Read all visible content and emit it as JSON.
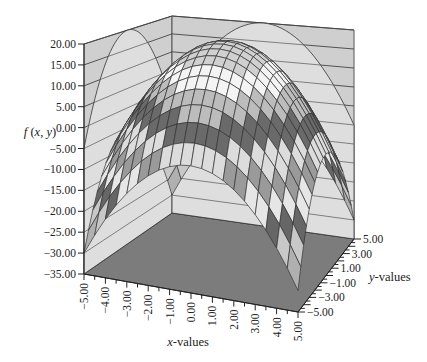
{
  "chart_data": {
    "type": "surface3d",
    "function": "f(x, y) = 20 - x^2 - y^2",
    "title": "",
    "xlabel": "x-values",
    "ylabel": "y-values",
    "zlabel": "f (x, y)",
    "xlim": [
      -5,
      5
    ],
    "ylim": [
      -5,
      5
    ],
    "zlim": [
      -35,
      20
    ],
    "x_ticks": [
      "-5.00",
      "-4.00",
      "-3.00",
      "-2.00",
      "-1.00",
      "0.00",
      "1.00",
      "2.00",
      "3.00",
      "4.00",
      "5.00"
    ],
    "y_ticks": [
      "5.00",
      "3.00",
      "1.00",
      "-1.00",
      "-3.00",
      "-5.00"
    ],
    "z_ticks": [
      "20.00",
      "15.00",
      "10.00",
      "5.00",
      "0.00",
      "-5.00",
      "-10.00",
      "-15.00",
      "-20.00",
      "-25.00",
      "-30.00",
      "-35.00"
    ],
    "grid_steps": 20,
    "band_step": 5,
    "band_colors": [
      "#8a8a8a",
      "#b0b0b0",
      "#c8c8c8",
      "#666666",
      "#e6e6e6",
      "#9a9a9a",
      "#dcdcdc",
      "#6a6a6a",
      "#bcbcbc",
      "#f4f4f4",
      "#d0d0d0"
    ],
    "colors": {
      "wall": "#cfcfcf",
      "floor": "#7c7c7c",
      "gridline": "#333333",
      "curtain": "#dedede"
    }
  }
}
